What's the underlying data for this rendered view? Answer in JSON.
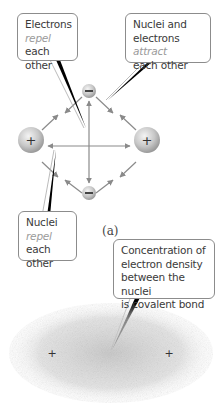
{
  "diagram": {
    "callouts": {
      "electrons_repel": {
        "line1": "Electrons",
        "em": "repel",
        "rest": " each",
        "line3": "other"
      },
      "attract": {
        "line1": "Nuclei and",
        "line2a": "electrons ",
        "em": "attract",
        "line3": "each other"
      },
      "nuclei_repel": {
        "line1": "Nuclei",
        "em": "repel",
        "rest": " each",
        "line3": "other"
      },
      "covalent": {
        "line1": "Concentration of",
        "line2": "electron density",
        "line3": "between the nuclei",
        "line4": "is covalent bond"
      }
    },
    "particles": {
      "nucleus_symbol": "+",
      "electron_symbol": "−"
    },
    "panel_label": "(a)",
    "colors": {
      "accent_text": "#9a9a9a",
      "border": "#8c8c8c",
      "arrow": "#8a8a8a",
      "pointer": "#000000"
    }
  }
}
